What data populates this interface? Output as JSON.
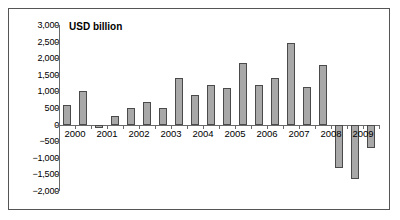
{
  "chart_data": {
    "type": "bar",
    "title": "USD billion",
    "xlabel": "",
    "ylabel": "USD billion",
    "ylim": [
      -2000,
      3000
    ],
    "ytick_labels": [
      "3,000",
      "2,500",
      "2,000",
      "1,500",
      "1,000",
      "500",
      "0",
      "−500",
      "−1,000",
      "−1,500",
      "−2,000"
    ],
    "ytick_values": [
      3000,
      2500,
      2000,
      1500,
      1000,
      500,
      0,
      -500,
      -1000,
      -1500,
      -2000
    ],
    "xtick_labels": [
      "2000",
      "2001",
      "2002",
      "2003",
      "2004",
      "2005",
      "2006",
      "2007",
      "2008",
      "2009"
    ],
    "categories": [
      "2000 H1",
      "2000 H2",
      "2001 H1",
      "2001 H2",
      "2002 H1",
      "2002 H2",
      "2003 H1",
      "2003 H2",
      "2004 H1",
      "2004 H2",
      "2005 H1",
      "2005 H2",
      "2006 H1",
      "2006 H2",
      "2007 H1",
      "2007 H2",
      "2008 H1",
      "2008 H2",
      "2009 H1",
      "2009 H2"
    ],
    "values": [
      600,
      1000,
      -100,
      260,
      500,
      690,
      500,
      1400,
      890,
      1190,
      1090,
      1850,
      1190,
      1390,
      2450,
      1130,
      1790,
      -1320,
      -1640,
      -720
    ],
    "grid": false,
    "legend": false,
    "bar_fill_color": "#a8a8a8",
    "bar_edge_color": "#4a4a4a",
    "axis_color": "#6a6a6a",
    "background_color": "#ffffff",
    "border_color": "#555555"
  }
}
